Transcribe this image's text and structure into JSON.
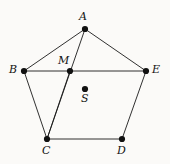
{
  "figure": {
    "name": "pentagon-with-interior-points",
    "width": 170,
    "height": 164,
    "background_color": "#fbfaf8",
    "stroke_color": "#1a1a1a",
    "dot_color": "#111111",
    "dot_radius": 3.1,
    "stroke_width": 0.9
  },
  "chart_data": {
    "type": "diagram",
    "title": "",
    "points": [
      {
        "id": "A",
        "label": "A",
        "x": 85,
        "y": 29,
        "label_x": 79,
        "label_y": 11,
        "label_anchor": "above"
      },
      {
        "id": "B",
        "label": "B",
        "x": 24,
        "y": 71,
        "label_x": 9,
        "label_y": 64,
        "label_anchor": "left"
      },
      {
        "id": "M",
        "label": "M",
        "x": 70,
        "y": 71,
        "label_x": 58,
        "label_y": 55,
        "label_anchor": "above-left"
      },
      {
        "id": "E",
        "label": "E",
        "x": 146,
        "y": 71,
        "label_x": 152,
        "label_y": 64,
        "label_anchor": "right"
      },
      {
        "id": "S",
        "label": "S",
        "x": 85,
        "y": 89,
        "label_x": 81,
        "label_y": 93,
        "label_anchor": "below"
      },
      {
        "id": "C",
        "label": "C",
        "x": 47,
        "y": 139,
        "label_x": 42,
        "label_y": 145,
        "label_anchor": "below"
      },
      {
        "id": "D",
        "label": "D",
        "x": 122,
        "y": 139,
        "label_x": 117,
        "label_y": 145,
        "label_anchor": "below"
      }
    ],
    "edges": [
      {
        "name": "edge-A-B",
        "from": "A",
        "to": "B"
      },
      {
        "name": "edge-A-E",
        "from": "A",
        "to": "E"
      },
      {
        "name": "edge-B-C",
        "from": "B",
        "to": "C"
      },
      {
        "name": "edge-E-D",
        "from": "E",
        "to": "D"
      },
      {
        "name": "edge-C-D",
        "from": "C",
        "to": "D"
      },
      {
        "name": "edge-B-E",
        "from": "B",
        "to": "E"
      },
      {
        "name": "edge-A-C",
        "from": "A",
        "to": "C"
      },
      {
        "name": "edge-M-C",
        "from": "M",
        "to": "C"
      }
    ]
  }
}
